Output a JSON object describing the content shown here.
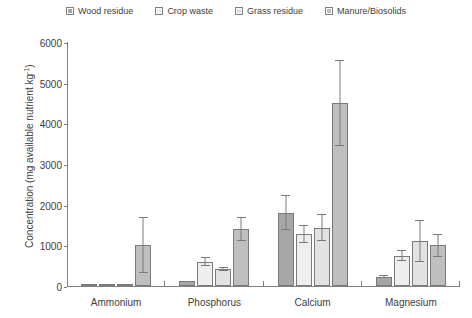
{
  "chart_data": {
    "type": "bar",
    "title": "",
    "xlabel": "",
    "ylabel": "Concentration (mg available nutrient kg",
    "ylabel_sup": "-1",
    "ylabel_tail": ")",
    "categories": [
      "Ammonium",
      "Phosphorus",
      "Calcium",
      "Magnesium"
    ],
    "ylim": [
      0,
      6000
    ],
    "yticks": [
      0,
      1000,
      2000,
      3000,
      4000,
      5000,
      6000
    ],
    "ytick_labels": [
      "0",
      "1000",
      "2000",
      "3000",
      "4000",
      "5000",
      "6000"
    ],
    "grid": false,
    "legend_position": "top-center",
    "series": [
      {
        "name": "Wood residue",
        "color": "#a6a6a6",
        "values": [
          40,
          120,
          1800,
          230
        ],
        "errors": [
          0,
          0,
          430,
          40
        ]
      },
      {
        "name": "Crop waste",
        "color": "#eeeeee",
        "values": [
          30,
          600,
          1280,
          750
        ],
        "errors": [
          0,
          110,
          230,
          130
        ]
      },
      {
        "name": "Grass residue",
        "color": "#e2e2e2",
        "values": [
          25,
          420,
          1430,
          1100
        ],
        "errors": [
          0,
          50,
          330,
          520
        ]
      },
      {
        "name": "Manure/Biosolids",
        "color": "#bfbfbf",
        "values": [
          1005,
          1400,
          4500,
          1000
        ],
        "errors": [
          690,
          300,
          1050,
          280
        ]
      }
    ]
  }
}
